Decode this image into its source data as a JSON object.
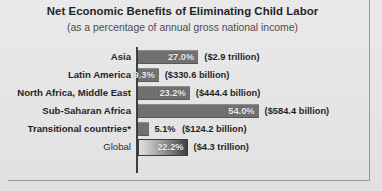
{
  "chart_data": {
    "type": "bar",
    "orientation": "horizontal",
    "title": "Net Economic Benefits of Eliminating Child Labor",
    "subtitle": "(as a percentage of annual gross national income)",
    "xlabel": "",
    "ylabel": "",
    "xlim": [
      0,
      60
    ],
    "grid": false,
    "legend": null,
    "categories": [
      "Asia",
      "Latin America",
      "North Africa, Middle East",
      "Sub-Saharan Africa",
      "Transitional countries*",
      "Global"
    ],
    "values": [
      27.0,
      9.3,
      23.2,
      54.0,
      5.1,
      22.2
    ],
    "value_labels": [
      "27.0%",
      "9.3%",
      "23.2%",
      "54.0%",
      "5.1%",
      "22.2%"
    ],
    "amount_labels": [
      "($2.9 trillion)",
      "($330.6 billion)",
      "($444.4 billion)",
      "($584.4 billion)",
      "($124.2 billion)",
      "($4.3 trillion)"
    ],
    "amounts_numeric_usd": [
      2900000000000,
      330600000000,
      444400000000,
      584400000000,
      124200000000,
      4300000000
    ],
    "colors": {
      "bar": "#6f6f6f",
      "global_bar_gradient_start": "#e2e2e2",
      "global_bar_gradient_end": "#3d3d3d",
      "background": "#e9e9e9",
      "text": "#1d1d1d",
      "axis": "#3b3b3b",
      "inside_label_text": "#f2f2f2"
    },
    "rows": [
      {
        "category": "Asia",
        "value": 27.0,
        "value_label": "27.0%",
        "amount_label": "($2.9 trillion)",
        "label_inside": true,
        "style": "solid"
      },
      {
        "category": "Latin America",
        "value": 9.3,
        "value_label": "9.3%",
        "amount_label": "($330.6 billion)",
        "label_inside": true,
        "style": "solid"
      },
      {
        "category": "North Africa, Middle East",
        "value": 23.2,
        "value_label": "23.2%",
        "amount_label": "($444.4 billion)",
        "label_inside": true,
        "style": "solid"
      },
      {
        "category": "Sub-Saharan Africa",
        "value": 54.0,
        "value_label": "54.0%",
        "amount_label": "($584.4 billion)",
        "label_inside": true,
        "style": "solid"
      },
      {
        "category": "Transitional countries*",
        "value": 5.1,
        "value_label": "5.1%",
        "amount_label": "($124.2 billion)",
        "label_inside": false,
        "style": "solid"
      },
      {
        "category": "Global",
        "value": 22.2,
        "value_label": "22.2%",
        "amount_label": "($4.3 trillion)",
        "label_inside": true,
        "style": "gradient"
      }
    ]
  }
}
